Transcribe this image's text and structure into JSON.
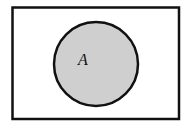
{
  "diagram": {
    "type": "venn",
    "universe": {
      "label": ""
    },
    "sets": [
      {
        "label": "A",
        "shaded": true
      }
    ],
    "colors": {
      "background": "#ffffff",
      "stroke": "#111111",
      "set_fill": "#cfcfcf"
    }
  }
}
